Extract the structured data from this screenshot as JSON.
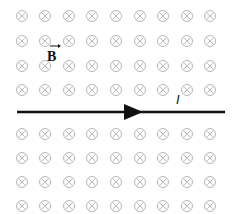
{
  "diagram": {
    "field_label": "B",
    "current_label": "I",
    "field_direction": "into page",
    "grid": {
      "columns": 9,
      "rows": 8
    },
    "colors": {
      "field_marks": "#b8b8b8",
      "wire": "#111111",
      "labels": "#111111"
    }
  }
}
